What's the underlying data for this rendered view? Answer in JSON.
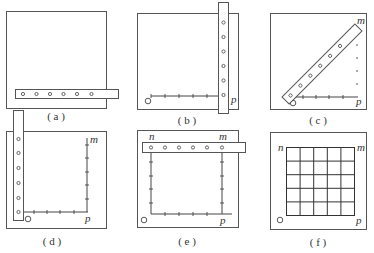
{
  "figure": {
    "panels": [
      {
        "id": "a",
        "caption": "( a )"
      },
      {
        "id": "b",
        "caption": "( b )",
        "labels": {
          "p": "p"
        }
      },
      {
        "id": "c",
        "caption": "( c )",
        "labels": {
          "p": "p",
          "m": "m"
        }
      },
      {
        "id": "d",
        "caption": "( d )",
        "labels": {
          "p": "p",
          "m": "m"
        }
      },
      {
        "id": "e",
        "caption": "( e )",
        "labels": {
          "p": "p",
          "m": "m",
          "n": "n"
        }
      },
      {
        "id": "f",
        "caption": "( f )",
        "labels": {
          "p": "p",
          "m": "m",
          "n": "n"
        }
      }
    ],
    "holes_per_bar": 6,
    "grid_cells": "5x5"
  }
}
